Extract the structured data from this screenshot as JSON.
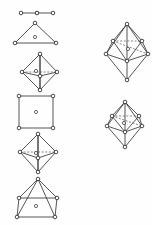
{
  "figure": {
    "background_color": "#fefefe",
    "line_color": "#2b2b2b",
    "dashed_line_color": "#555555",
    "vertex_fill": "#ffffff",
    "vertex_radius": 1.8,
    "center_radius": 1.6,
    "width": 152,
    "height": 225,
    "columns": [
      {
        "name": "left-column",
        "shapes": [
          {
            "id": "linear",
            "label": "linear",
            "coordination_number": 2,
            "origin": [
              18,
              7
            ],
            "vertices": [
              [
                0,
                3
              ],
              [
                16,
                3
              ],
              [
                32,
                3
              ]
            ],
            "center": [
              16,
              3
            ],
            "edges": [
              [
                0,
                1
              ],
              [
                1,
                2
              ]
            ],
            "dashed_edges": []
          },
          {
            "id": "trigonal-planar",
            "label": "trigonal planar (triangle)",
            "coordination_number": 3,
            "origin": [
              12,
              20
            ],
            "vertices": [
              [
                20,
                0
              ],
              [
                0,
                20
              ],
              [
                41,
                20
              ]
            ],
            "center": [
              20,
              14
            ],
            "edges": [
              [
                0,
                1
              ],
              [
                1,
                2
              ],
              [
                2,
                0
              ]
            ],
            "dashed_edges": []
          },
          {
            "id": "tetrahedron",
            "label": "tetrahedron",
            "coordination_number": 4,
            "origin": [
              19,
              51
            ],
            "vertices": [
              [
                18,
                0
              ],
              [
                0,
                18
              ],
              [
                35,
                18
              ],
              [
                18,
                22
              ],
              [
                18,
                36
              ]
            ],
            "center": [
              14,
              17
            ],
            "edges": [
              [
                0,
                1
              ],
              [
                0,
                2
              ],
              [
                0,
                4
              ],
              [
                1,
                4
              ],
              [
                2,
                4
              ],
              [
                0,
                3
              ],
              [
                1,
                3
              ],
              [
                2,
                3
              ],
              [
                3,
                4
              ]
            ],
            "dashed_edges": [
              [
                1,
                2
              ]
            ]
          },
          {
            "id": "square-planar",
            "label": "square planar",
            "coordination_number": 4,
            "origin": [
              16,
              93
            ],
            "vertices": [
              [
                0,
                0
              ],
              [
                34,
                0
              ],
              [
                34,
                32
              ],
              [
                0,
                32
              ]
            ],
            "center": [
              17,
              16
            ],
            "edges": [
              [
                0,
                1
              ],
              [
                1,
                2
              ],
              [
                2,
                3
              ],
              [
                3,
                0
              ]
            ],
            "dashed_edges": []
          },
          {
            "id": "trigonal-bipyramid",
            "label": "trigonal bipyramid",
            "coordination_number": 5,
            "origin": [
              17,
              131
            ],
            "vertices": [
              [
                18,
                0
              ],
              [
                0,
                18
              ],
              [
                36,
                18
              ],
              [
                18,
                24
              ],
              [
                18,
                38
              ]
            ],
            "center": [
              16,
              19
            ],
            "edges": [
              [
                0,
                1
              ],
              [
                0,
                2
              ],
              [
                0,
                3
              ],
              [
                1,
                3
              ],
              [
                2,
                3
              ],
              [
                1,
                4
              ],
              [
                2,
                4
              ],
              [
                3,
                4
              ],
              [
                0,
                4
              ]
            ],
            "dashed_edges": [
              [
                1,
                2
              ]
            ]
          },
          {
            "id": "square-pyramid",
            "label": "square pyramid",
            "coordination_number": 5,
            "origin": [
              14,
              176
            ],
            "vertices": [
              [
                21,
                0
              ],
              [
                2,
                19
              ],
              [
                40,
                19
              ],
              [
                0,
                38
              ],
              [
                38,
                38
              ]
            ],
            "center": [
              19,
              27
            ],
            "edges": [
              [
                0,
                1
              ],
              [
                0,
                2
              ],
              [
                0,
                3
              ],
              [
                0,
                4
              ],
              [
                1,
                2
              ],
              [
                1,
                3
              ],
              [
                2,
                4
              ],
              [
                3,
                4
              ]
            ],
            "dashed_edges": []
          }
        ]
      },
      {
        "name": "right-column",
        "shapes": [
          {
            "id": "pentagonal-bipyramid",
            "label": "pentagonal bipyramid",
            "coordination_number": 7,
            "origin": [
              101,
              21
            ],
            "vertices": [
              [
                23,
                0
              ],
              [
                9,
                17
              ],
              [
                38,
                17
              ],
              [
                2,
                30
              ],
              [
                44,
                30
              ],
              [
                23,
                37
              ],
              [
                23,
                56
              ]
            ],
            "center": [
              24,
              25
            ],
            "edges": [
              [
                0,
                1
              ],
              [
                0,
                2
              ],
              [
                0,
                3
              ],
              [
                0,
                4
              ],
              [
                1,
                3
              ],
              [
                2,
                4
              ],
              [
                3,
                5
              ],
              [
                4,
                5
              ],
              [
                1,
                5
              ],
              [
                2,
                5
              ],
              [
                3,
                6
              ],
              [
                4,
                6
              ],
              [
                5,
                6
              ],
              [
                0,
                5
              ]
            ],
            "dashed_edges": [
              [
                1,
                2
              ],
              [
                1,
                4
              ]
            ]
          },
          {
            "id": "bicapped-bipyramid",
            "label": "distorted bipyramid",
            "coordination_number": 7,
            "origin": [
              103,
              99
            ],
            "vertices": [
              [
                19,
                0
              ],
              [
                6,
                14
              ],
              [
                33,
                14
              ],
              [
                1,
                24
              ],
              [
                36,
                24
              ],
              [
                19,
                30
              ],
              [
                19,
                45
              ]
            ],
            "center": [
              18,
              21
            ],
            "edges": [
              [
                0,
                1
              ],
              [
                0,
                2
              ],
              [
                0,
                3
              ],
              [
                0,
                4
              ],
              [
                1,
                3
              ],
              [
                2,
                4
              ],
              [
                3,
                5
              ],
              [
                4,
                5
              ],
              [
                1,
                5
              ],
              [
                2,
                5
              ],
              [
                3,
                6
              ],
              [
                4,
                6
              ],
              [
                5,
                6
              ],
              [
                0,
                5
              ]
            ],
            "dashed_edges": [
              [
                1,
                2
              ],
              [
                1,
                4
              ]
            ]
          }
        ]
      }
    ]
  }
}
